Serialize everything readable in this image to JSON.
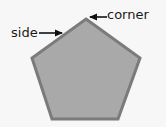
{
  "diagram": {
    "shape": "pentagon",
    "colors": {
      "background": "#f7f7f7",
      "fill": "#a9a9a9",
      "stroke": "#7b7b7b",
      "arrow": "#111111",
      "text": "#1a1a1a"
    },
    "vertices": [
      [
        86,
        19
      ],
      [
        140,
        58
      ],
      [
        118,
        119
      ],
      [
        52,
        119
      ],
      [
        32,
        58
      ]
    ],
    "labels": {
      "side": "side",
      "corner": "corner"
    },
    "arrows": {
      "side": {
        "from": [
          39,
          33
        ],
        "to": [
          63,
          33
        ],
        "points_to": "side"
      },
      "corner": {
        "from": [
          107,
          17
        ],
        "to": [
          88,
          17
        ],
        "points_to": "corner"
      }
    }
  }
}
